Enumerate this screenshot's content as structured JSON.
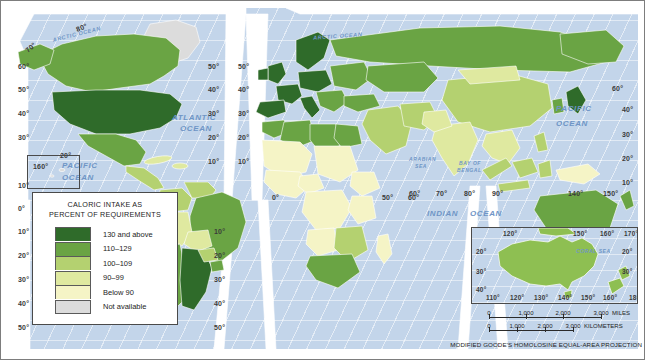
{
  "figure": {
    "kind": "thematic-world-map",
    "projection_note": "MODIFIED GOODE'S HOMOLOSINE EQUAL-AREA PROJECTION"
  },
  "legend": {
    "title_line1": "CALORIC INTAKE AS",
    "title_line2": "PERCENT OF REQUIREMENTS",
    "classes": [
      {
        "label": "130 and above",
        "color": "#2f6b2a"
      },
      {
        "label": "110–129",
        "color": "#6aa444"
      },
      {
        "label": "100–109",
        "color": "#b4d170"
      },
      {
        "label": "90–99",
        "color": "#dfe9a0"
      },
      {
        "label": "Below 90",
        "color": "#f5f4c6"
      },
      {
        "label": "Not available",
        "color": "#dcdcdc"
      }
    ]
  },
  "ocean_labels": [
    {
      "id": "arctic-west",
      "text": "ARCTIC OCEAN",
      "x": 52,
      "y": 31,
      "size": "small",
      "rot": -14
    },
    {
      "id": "arctic-east",
      "text": "ARCTIC OCEAN",
      "x": 313,
      "y": 33,
      "size": "small",
      "rot": -4
    },
    {
      "id": "atlantic",
      "text": "ATLANTIC",
      "x": 172,
      "y": 113,
      "size": "big",
      "rot": 0
    },
    {
      "id": "atlantic-2",
      "text": "OCEAN",
      "x": 180,
      "y": 124,
      "size": "big",
      "rot": 0
    },
    {
      "id": "pacific-right",
      "text": "PACIFIC",
      "x": 556,
      "y": 104,
      "size": "big",
      "rot": 0
    },
    {
      "id": "pacific-right-2",
      "text": "OCEAN",
      "x": 556,
      "y": 119,
      "size": "big",
      "rot": 0
    },
    {
      "id": "pacific-left",
      "text": "PACIFIC",
      "x": 62,
      "y": 161,
      "size": "big",
      "rot": 0
    },
    {
      "id": "pacific-left-2",
      "text": "OCEAN",
      "x": 62,
      "y": 173,
      "size": "big",
      "rot": 0
    },
    {
      "id": "arabian-sea",
      "text": "ARABIAN",
      "x": 409,
      "y": 156,
      "size": "tiny",
      "rot": 0
    },
    {
      "id": "arabian-sea-2",
      "text": "SEA",
      "x": 415,
      "y": 163,
      "size": "tiny",
      "rot": 0
    },
    {
      "id": "bay-of-bengal",
      "text": "BAY OF",
      "x": 459,
      "y": 160,
      "size": "tiny",
      "rot": 0
    },
    {
      "id": "bay-of-bengal-2",
      "text": "BENGAL",
      "x": 457,
      "y": 167,
      "size": "tiny",
      "rot": 0
    },
    {
      "id": "indian-ocean",
      "text": "INDIAN",
      "x": 427,
      "y": 209,
      "size": "big",
      "rot": 0
    },
    {
      "id": "indian-ocean-2",
      "text": "OCEAN",
      "x": 470,
      "y": 209,
      "size": "big",
      "rot": 0
    }
  ],
  "graticule_labels": [
    {
      "id": "lat-w-80",
      "text": "80°",
      "x": 76,
      "y": 24,
      "rot": -22
    },
    {
      "id": "lat-w-70",
      "text": "70°",
      "x": 25,
      "y": 44,
      "rot": -42
    },
    {
      "id": "lat-w-60",
      "text": "60°",
      "x": 18,
      "y": 63,
      "rot": 0
    },
    {
      "id": "lat-w-50",
      "text": "50°",
      "x": 18,
      "y": 86,
      "rot": 0
    },
    {
      "id": "lat-w-40",
      "text": "40°",
      "x": 18,
      "y": 110,
      "rot": 0
    },
    {
      "id": "lat-w-30",
      "text": "30°",
      "x": 18,
      "y": 134,
      "rot": 0
    },
    {
      "id": "lat-w-10",
      "text": "10°",
      "x": 18,
      "y": 182,
      "rot": 0
    },
    {
      "id": "lat-w-0",
      "text": "0°",
      "x": 18,
      "y": 205,
      "rot": 0
    },
    {
      "id": "lat-w-s10",
      "text": "10°",
      "x": 18,
      "y": 228,
      "rot": 0
    },
    {
      "id": "lat-w-s20",
      "text": "20°",
      "x": 18,
      "y": 252,
      "rot": 0
    },
    {
      "id": "lat-w-s30",
      "text": "30°",
      "x": 18,
      "y": 276,
      "rot": 0
    },
    {
      "id": "lat-w-s40",
      "text": "40°",
      "x": 18,
      "y": 300,
      "rot": 0
    },
    {
      "id": "lat-w-s50",
      "text": "50°",
      "x": 18,
      "y": 324,
      "rot": 0
    },
    {
      "id": "lon-160",
      "text": "160°",
      "x": 33,
      "y": 163,
      "rot": 0
    },
    {
      "id": "lon-20-left",
      "text": "20°",
      "x": 60,
      "y": 152,
      "rot": 0
    },
    {
      "id": "lat-c-50a",
      "text": "50°",
      "x": 208,
      "y": 63,
      "rot": 0
    },
    {
      "id": "lat-c-40a",
      "text": "40°",
      "x": 208,
      "y": 86,
      "rot": 0
    },
    {
      "id": "lat-c-30a",
      "text": "30°",
      "x": 208,
      "y": 110,
      "rot": 0
    },
    {
      "id": "lat-c-20a",
      "text": "20°",
      "x": 208,
      "y": 134,
      "rot": 0
    },
    {
      "id": "lat-c-10a",
      "text": "10°",
      "x": 208,
      "y": 158,
      "rot": 0
    },
    {
      "id": "lat-c-50b",
      "text": "50°",
      "x": 238,
      "y": 63,
      "rot": 0
    },
    {
      "id": "lat-c-40b",
      "text": "40°",
      "x": 238,
      "y": 86,
      "rot": 0
    },
    {
      "id": "lat-c-30b",
      "text": "30°",
      "x": 238,
      "y": 110,
      "rot": 0
    },
    {
      "id": "lat-c-20b",
      "text": "20°",
      "x": 238,
      "y": 134,
      "rot": 0
    },
    {
      "id": "lat-c-10b",
      "text": "10°",
      "x": 238,
      "y": 158,
      "rot": 0
    },
    {
      "id": "lat-c-s10",
      "text": "10°",
      "x": 214,
      "y": 228,
      "rot": 0
    },
    {
      "id": "lat-c-s20",
      "text": "20°",
      "x": 214,
      "y": 252,
      "rot": 0
    },
    {
      "id": "lat-c-s30",
      "text": "30°",
      "x": 214,
      "y": 276,
      "rot": 0
    },
    {
      "id": "lat-c-s40",
      "text": "40°",
      "x": 214,
      "y": 300,
      "rot": 0
    },
    {
      "id": "lat-c-s50",
      "text": "50°",
      "x": 214,
      "y": 324,
      "rot": 0
    },
    {
      "id": "lon-0",
      "text": "0°",
      "x": 272,
      "y": 194,
      "rot": 0
    },
    {
      "id": "lon-50",
      "text": "50°",
      "x": 382,
      "y": 194,
      "rot": 0
    },
    {
      "id": "lon-60",
      "text": "60°",
      "x": 408,
      "y": 194,
      "rot": 0
    },
    {
      "id": "lon-60b",
      "text": "60°",
      "x": 409,
      "y": 190,
      "rot": 0
    },
    {
      "id": "lon-70",
      "text": "70°",
      "x": 436,
      "y": 190,
      "rot": 0
    },
    {
      "id": "lon-80",
      "text": "80°",
      "x": 464,
      "y": 190,
      "rot": 0
    },
    {
      "id": "lon-90",
      "text": "90°",
      "x": 492,
      "y": 190,
      "rot": 0
    },
    {
      "id": "lat-e-60",
      "text": "60°",
      "x": 612,
      "y": 85,
      "rot": 0
    },
    {
      "id": "lat-e-40",
      "text": "40°",
      "x": 622,
      "y": 106,
      "rot": 0
    },
    {
      "id": "lat-e-30",
      "text": "30°",
      "x": 622,
      "y": 131,
      "rot": 0
    },
    {
      "id": "lat-e-20",
      "text": "20°",
      "x": 622,
      "y": 155,
      "rot": 0
    },
    {
      "id": "lat-e-10",
      "text": "10°",
      "x": 622,
      "y": 179,
      "rot": 0
    },
    {
      "id": "lon-140",
      "text": "140°",
      "x": 568,
      "y": 190,
      "rot": 0
    },
    {
      "id": "lon-150",
      "text": "150°",
      "x": 603,
      "y": 190,
      "rot": 0
    }
  ],
  "australia_inset": {
    "sea_label": "CORAL SEA",
    "top_labels": [
      {
        "text": "120°",
        "x": 31
      },
      {
        "text": "150°",
        "x": 101
      },
      {
        "text": "160°",
        "x": 128
      },
      {
        "text": "170°",
        "x": 152
      }
    ],
    "bottom_labels": [
      {
        "text": "110°",
        "x": 14
      },
      {
        "text": "120°",
        "x": 38
      },
      {
        "text": "130°",
        "x": 62
      },
      {
        "text": "140°",
        "x": 86
      },
      {
        "text": "150°",
        "x": 109
      },
      {
        "text": "160°",
        "x": 131
      },
      {
        "text": "180°",
        "x": 157
      }
    ],
    "left_labels": [
      {
        "text": "20°",
        "y": 20
      },
      {
        "text": "30°",
        "y": 40
      },
      {
        "text": "40°",
        "y": 58
      }
    ],
    "right_labels": [
      {
        "text": "20°",
        "y": 20
      },
      {
        "text": "30°",
        "y": 40
      }
    ]
  },
  "scale_bars": [
    {
      "id": "miles",
      "unit": "MILES",
      "ticks": [
        "0",
        "1,000",
        "2,000",
        "3,000"
      ]
    },
    {
      "id": "kilometers",
      "unit": "KILOMETERS",
      "ticks": [
        "0",
        "1,000",
        "2,000",
        "3,000"
      ]
    }
  ]
}
